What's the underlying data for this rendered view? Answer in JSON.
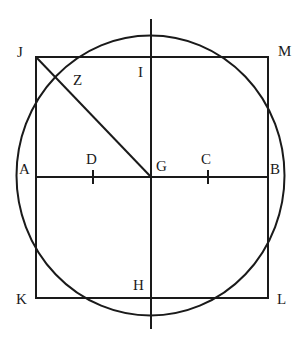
{
  "diagram": {
    "type": "geometric construction",
    "stroke_color": "#1a1a1a",
    "background": "#ffffff",
    "shapes": {
      "square": {
        "vertices": [
          "J",
          "M",
          "L",
          "K"
        ]
      },
      "circle": {
        "center": "G"
      },
      "horizontal_line": {
        "from": "A",
        "to": "B",
        "ticks": [
          "D",
          "C"
        ]
      },
      "vertical_line": {
        "through": [
          "I",
          "G",
          "H"
        ]
      },
      "diagonal": {
        "from": "J",
        "to": "G",
        "crosses_circle_at": "Z"
      }
    },
    "labels": {
      "J": "J",
      "M": "M",
      "K": "K",
      "L": "L",
      "I": "I",
      "Z": "Z",
      "A": "A",
      "D": "D",
      "G": "G",
      "C": "C",
      "B": "B",
      "H": "H"
    }
  }
}
